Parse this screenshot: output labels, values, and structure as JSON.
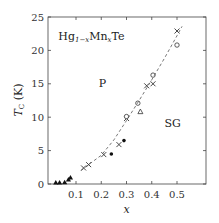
{
  "chart_data": {
    "type": "scatter",
    "title": "",
    "xlabel": "x",
    "ylabel": "T_C (K)",
    "xlim": [
      0,
      0.617
    ],
    "ylim": [
      0,
      25
    ],
    "grid": false,
    "x_ticks": [
      0.1,
      0.2,
      0.3,
      0.4,
      0.5
    ],
    "x_tick_labels": [
      "0.1",
      "0.2",
      "0.3",
      "0.4",
      "0.5"
    ],
    "y_ticks": [
      0,
      5,
      10,
      15,
      20,
      25
    ],
    "y_tick_labels": [
      "0",
      "5",
      "10",
      "15",
      "20",
      "25"
    ],
    "annotations": [
      {
        "text": "Hg1-xMnxTe",
        "x": 0.03,
        "y": 21.5
      },
      {
        "text": "P",
        "x": 0.19,
        "y": 14.5
      },
      {
        "text": "SG",
        "x": 0.45,
        "y": 8.5
      }
    ],
    "series": [
      {
        "name": "crosses",
        "marker": "x",
        "x": [
          0.13,
          0.15,
          0.21,
          0.27,
          0.3,
          0.38,
          0.405,
          0.5
        ],
        "y": [
          2.4,
          2.9,
          4.4,
          5.9,
          9.8,
          14.7,
          15.0,
          22.9
        ]
      },
      {
        "name": "open circles",
        "marker": "o",
        "x": [
          0.3,
          0.345,
          0.405,
          0.5
        ],
        "y": [
          10.1,
          12.1,
          16.3,
          20.8
        ]
      },
      {
        "name": "open triangles",
        "marker": "^",
        "x": [
          0.355
        ],
        "y": [
          10.8
        ]
      },
      {
        "name": "filled circles",
        "marker": "filled-o",
        "x": [
          0.24,
          0.29
        ],
        "y": [
          4.5,
          6.5
        ]
      },
      {
        "name": "filled triangles",
        "marker": "filled-^",
        "x": [
          0.02,
          0.035,
          0.055,
          0.07,
          0.078
        ],
        "y": [
          0.15,
          0.15,
          0.2,
          0.6,
          0.9
        ]
      },
      {
        "name": "fit (dashed)",
        "marker": "none",
        "style": "dashed",
        "x": [
          0.12,
          0.15,
          0.2,
          0.25,
          0.3,
          0.35,
          0.4,
          0.45,
          0.5,
          0.52
        ],
        "y": [
          2.0,
          2.9,
          4.3,
          6.6,
          9.5,
          12.5,
          15.6,
          18.8,
          22.2,
          23.6
        ]
      }
    ]
  }
}
